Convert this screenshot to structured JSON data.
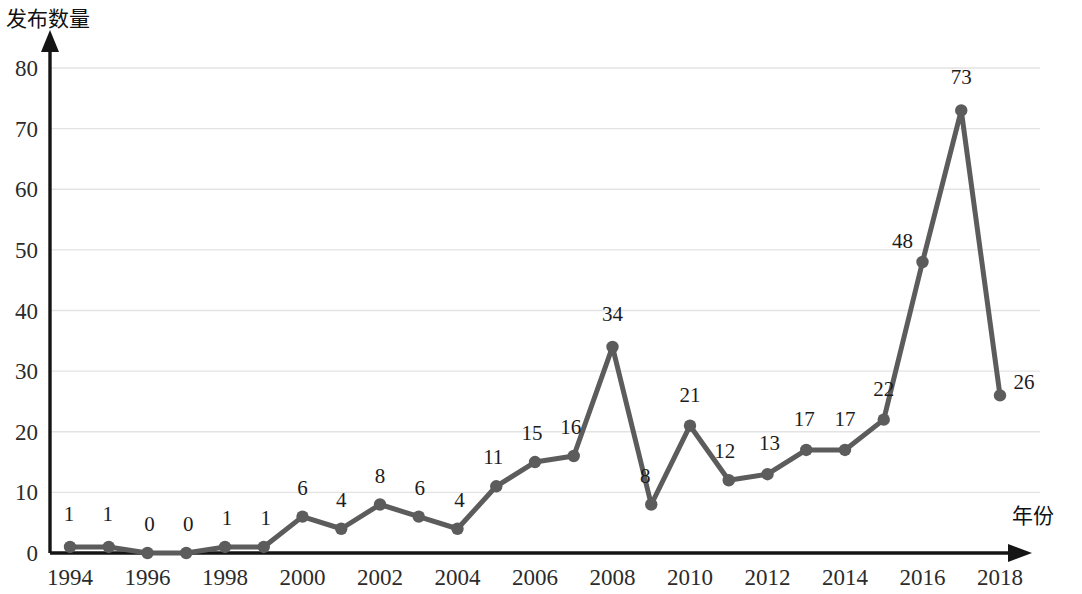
{
  "chart_data": {
    "type": "line",
    "title": "",
    "xlabel": "年份",
    "ylabel": "发布数量",
    "x": [
      1994,
      1995,
      1996,
      1997,
      1998,
      1999,
      2000,
      2001,
      2002,
      2003,
      2004,
      2005,
      2006,
      2007,
      2008,
      2009,
      2010,
      2011,
      2012,
      2013,
      2014,
      2015,
      2016,
      2017,
      2018
    ],
    "values": [
      1,
      1,
      0,
      0,
      1,
      1,
      6,
      4,
      8,
      6,
      4,
      11,
      15,
      16,
      34,
      8,
      21,
      12,
      13,
      17,
      17,
      22,
      48,
      73,
      26
    ],
    "point_labels": [
      "1",
      "1",
      "0",
      "0",
      "1",
      "1",
      "6",
      "4",
      "8",
      "6",
      "4",
      "11",
      "15",
      "16",
      "34",
      "8",
      "21",
      "12",
      "13",
      "17",
      "17",
      "22",
      "48",
      "73",
      "26"
    ],
    "xtick_labels": [
      "1994",
      "1996",
      "1998",
      "2000",
      "2002",
      "2004",
      "2006",
      "2008",
      "2010",
      "2012",
      "2014",
      "2016",
      "2018"
    ],
    "xtick_values": [
      1994,
      1996,
      1998,
      2000,
      2002,
      2004,
      2006,
      2008,
      2010,
      2012,
      2014,
      2016,
      2018
    ],
    "ytick_labels": [
      "0",
      "10",
      "20",
      "30",
      "40",
      "50",
      "60",
      "70",
      "80"
    ],
    "ytick_values": [
      0,
      10,
      20,
      30,
      40,
      50,
      60,
      70,
      80
    ],
    "xlim": [
      1994,
      2018
    ],
    "ylim": [
      0,
      80
    ],
    "grid": "horizontal",
    "legend": "none",
    "series_color": "#5c5c5c",
    "grid_color": "#e3e3e3",
    "axis_color": "#151515",
    "marker": "circle"
  }
}
